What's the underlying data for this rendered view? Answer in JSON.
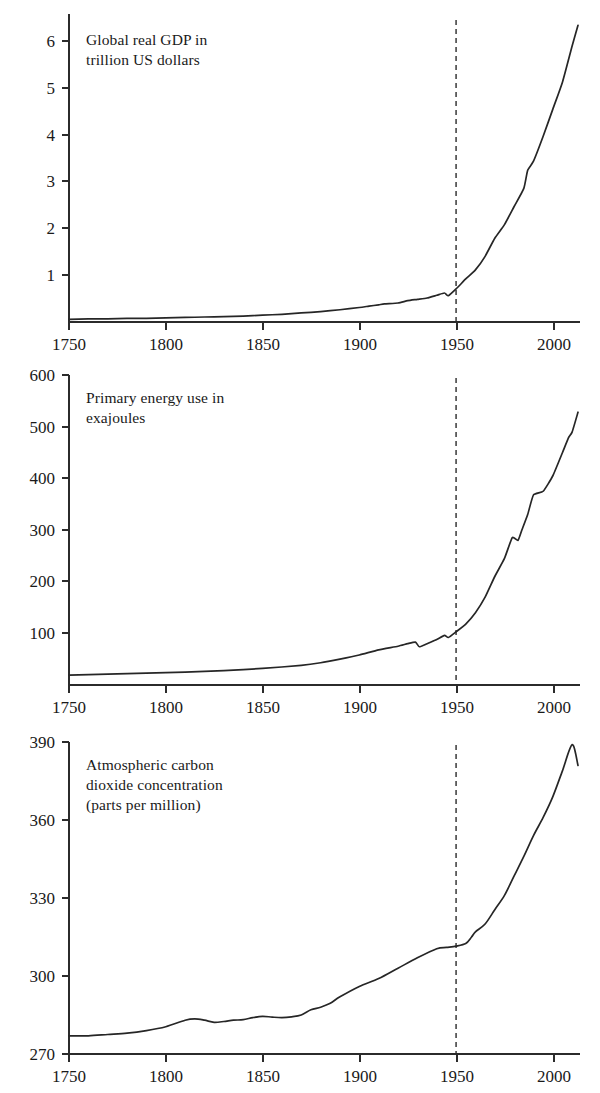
{
  "figure": {
    "name": "great-acceleration-three-panel-figure",
    "background": "#ffffff",
    "line_color": "#262626",
    "axis_color": "#2b2b2b",
    "marker_year_label": "1950"
  },
  "chart_data": [
    {
      "id": "gdp",
      "type": "line",
      "title": "",
      "annotation": "Global real GDP in\ntrillion US dollars",
      "xlabel": "",
      "ylabel": "",
      "xlim": [
        1750,
        2013
      ],
      "ylim": [
        0,
        6.8
      ],
      "grid": false,
      "legend": "none",
      "xticks": [
        1750,
        1800,
        1850,
        1900,
        1950,
        2000
      ],
      "xtick_labels": [
        "1750",
        "1800",
        "1850",
        "1900",
        "1950",
        "2000"
      ],
      "yticks": [
        1,
        2,
        3,
        4,
        5,
        6
      ],
      "ytick_labels": [
        "1",
        "2",
        "3",
        "4",
        "5",
        "6"
      ],
      "annotations": [
        {
          "type": "vline",
          "x": 1950,
          "style": "dashed"
        }
      ],
      "x": [
        1750,
        1760,
        1770,
        1780,
        1790,
        1800,
        1810,
        1820,
        1830,
        1840,
        1850,
        1860,
        1870,
        1880,
        1890,
        1900,
        1905,
        1910,
        1913,
        1920,
        1925,
        1930,
        1935,
        1940,
        1944,
        1946,
        1950,
        1955,
        1960,
        1965,
        1970,
        1975,
        1980,
        1985,
        1987,
        1990,
        1995,
        2000,
        2005,
        2010,
        2013
      ],
      "y": [
        0.06,
        0.07,
        0.07,
        0.08,
        0.08,
        0.09,
        0.1,
        0.11,
        0.12,
        0.13,
        0.15,
        0.17,
        0.2,
        0.23,
        0.27,
        0.32,
        0.35,
        0.38,
        0.4,
        0.42,
        0.47,
        0.5,
        0.53,
        0.59,
        0.64,
        0.58,
        0.73,
        0.95,
        1.15,
        1.45,
        1.85,
        2.15,
        2.55,
        2.95,
        3.35,
        3.55,
        4.1,
        4.7,
        5.3,
        6.1,
        6.55
      ]
    },
    {
      "id": "energy",
      "type": "line",
      "title": "",
      "annotation": "Primary energy use in\nexajoules",
      "xlabel": "",
      "ylabel": "",
      "xlim": [
        1750,
        2013
      ],
      "ylim": [
        0,
        600
      ],
      "grid": false,
      "legend": "none",
      "xticks": [
        1750,
        1800,
        1850,
        1900,
        1950,
        2000
      ],
      "xtick_labels": [
        "1750",
        "1800",
        "1850",
        "1900",
        "1950",
        "2000"
      ],
      "yticks": [
        100,
        200,
        300,
        400,
        500,
        600
      ],
      "ytick_labels": [
        "100",
        "200",
        "300",
        "400",
        "500",
        "600"
      ],
      "annotations": [
        {
          "type": "vline",
          "x": 1950,
          "style": "dashed"
        }
      ],
      "x": [
        1750,
        1770,
        1790,
        1810,
        1830,
        1850,
        1870,
        1880,
        1890,
        1900,
        1910,
        1920,
        1925,
        1929,
        1931,
        1935,
        1940,
        1944,
        1946,
        1950,
        1955,
        1960,
        1965,
        1970,
        1975,
        1979,
        1982,
        1984,
        1987,
        1990,
        1995,
        2000,
        2005,
        2008,
        2010,
        2013
      ],
      "y": [
        19,
        21,
        23,
        25,
        28,
        32,
        38,
        43,
        50,
        58,
        68,
        75,
        80,
        83,
        74,
        80,
        88,
        96,
        92,
        103,
        118,
        140,
        170,
        210,
        245,
        285,
        280,
        300,
        330,
        368,
        375,
        405,
        450,
        478,
        490,
        528
      ]
    },
    {
      "id": "co2",
      "type": "line",
      "title": "",
      "annotation": "Atmospheric carbon\ndioxide concentration\n(parts per million)",
      "xlabel": "",
      "ylabel": "",
      "xlim": [
        1750,
        2013
      ],
      "ylim": [
        270,
        390
      ],
      "grid": false,
      "legend": "none",
      "xticks": [
        1750,
        1800,
        1850,
        1900,
        1950,
        2000
      ],
      "xtick_labels": [
        "1750",
        "1800",
        "1850",
        "1900",
        "1950",
        "2000"
      ],
      "yticks": [
        270,
        300,
        330,
        360,
        390
      ],
      "ytick_labels": [
        "270",
        "300",
        "330",
        "360",
        "390"
      ],
      "annotations": [
        {
          "type": "vline",
          "x": 1950,
          "style": "dashed"
        }
      ],
      "x": [
        1750,
        1760,
        1770,
        1780,
        1790,
        1800,
        1810,
        1815,
        1820,
        1825,
        1830,
        1835,
        1840,
        1845,
        1850,
        1855,
        1860,
        1865,
        1870,
        1875,
        1880,
        1885,
        1890,
        1900,
        1910,
        1920,
        1930,
        1940,
        1945,
        1950,
        1955,
        1958,
        1960,
        1965,
        1970,
        1975,
        1980,
        1985,
        1990,
        1995,
        2000,
        2005,
        2010,
        2013
      ],
      "y": [
        277,
        277,
        277.5,
        278,
        279,
        280.5,
        283,
        283.5,
        283,
        282.2,
        282.5,
        283,
        283.2,
        284,
        284.5,
        284.2,
        284,
        284.3,
        285,
        287,
        288,
        289.5,
        292,
        296,
        299,
        303,
        307,
        310.5,
        311,
        311.5,
        312.5,
        315,
        317,
        320,
        325.5,
        331,
        338.5,
        346,
        354,
        361,
        369,
        379,
        389,
        381
      ]
    }
  ],
  "panels": [
    {
      "name": "gdp-panel",
      "caption": "Global real GDP in\ntrillion US dollars"
    },
    {
      "name": "energy-panel",
      "caption": "Primary energy use in\nexajoules"
    },
    {
      "name": "co2-panel",
      "caption": "Atmospheric carbon\ndioxide concentration\n(parts per million)"
    }
  ]
}
